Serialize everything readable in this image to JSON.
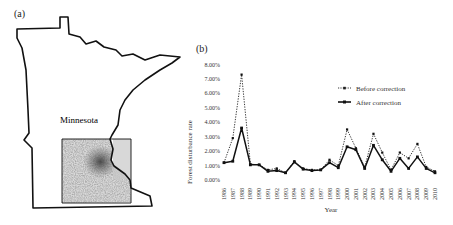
{
  "panel_a": {
    "label": "(a)",
    "state_name": "Minnesota"
  },
  "panel_b": {
    "label": "(b)"
  },
  "chart_data": {
    "type": "line",
    "title": "",
    "xlabel": "Year",
    "ylabel": "Forest disturbance rate",
    "x": [
      "1986",
      "1987",
      "1988",
      "1989",
      "1990",
      "1991",
      "1992",
      "1993",
      "1994",
      "1995",
      "1996",
      "1997",
      "1998",
      "1999",
      "2000",
      "2001",
      "2002",
      "2003",
      "2004",
      "2005",
      "2006",
      "2007",
      "2008",
      "2009",
      "2010"
    ],
    "ylim": [
      0,
      8
    ],
    "yticks": [
      "0.00%",
      "1.00%",
      "2.00%",
      "3.00%",
      "4.00%",
      "5.00%",
      "6.00%",
      "7.00%",
      "8.00%"
    ],
    "grid": false,
    "legend_position": "top-right",
    "series": [
      {
        "name": "Before correction",
        "style": "dotted",
        "values": [
          1.2,
          2.9,
          7.3,
          1.1,
          1.05,
          0.7,
          0.8,
          0.5,
          1.3,
          0.8,
          0.7,
          0.7,
          1.4,
          1.0,
          3.5,
          2.2,
          0.9,
          3.2,
          1.9,
          0.7,
          1.9,
          1.5,
          2.5,
          0.9,
          0.6
        ]
      },
      {
        "name": "After correction",
        "style": "solid",
        "values": [
          1.2,
          1.3,
          3.6,
          1.05,
          1.05,
          0.6,
          0.65,
          0.5,
          1.25,
          0.75,
          0.65,
          0.7,
          1.2,
          0.85,
          2.3,
          2.1,
          0.8,
          2.4,
          1.4,
          0.6,
          1.5,
          0.8,
          1.6,
          0.8,
          0.5
        ]
      }
    ]
  }
}
